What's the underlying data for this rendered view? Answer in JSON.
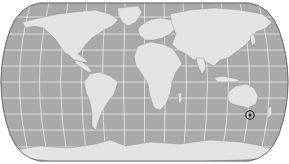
{
  "map": {
    "projection": "Robinson",
    "style": "grayscale",
    "colors": {
      "background": "#ffffff",
      "ocean": "#a9a9a9",
      "land": "#e3e3e3",
      "graticule": "#f4f4f4",
      "coast": "#8a8a8a",
      "marker": "#1a1a1a"
    },
    "marker": {
      "label": "location-marker",
      "region": "southeast Australia / Tasman Sea"
    }
  }
}
